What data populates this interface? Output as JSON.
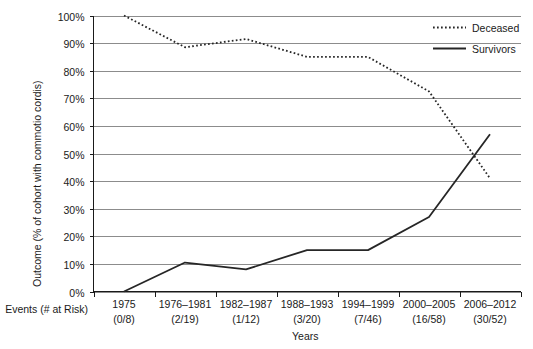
{
  "chart_data": {
    "type": "line",
    "title": "",
    "xlabel": "Years",
    "ylabel": "Outcome (% of cohort with commotio cordis)",
    "categories": [
      "1975",
      "1976–1981",
      "1982–1987",
      "1988–1993",
      "1994–1999",
      "2000–2005",
      "2006–2012"
    ],
    "ylim": [
      0,
      100
    ],
    "ytick_labels": [
      "0%",
      "10%",
      "20%",
      "30%",
      "40%",
      "50%",
      "60%",
      "70%",
      "80%",
      "90%",
      "100%"
    ],
    "ytick_values": [
      0,
      10,
      20,
      30,
      40,
      50,
      60,
      70,
      80,
      90,
      100
    ],
    "grid": true,
    "legend_position": "top-right",
    "series": [
      {
        "name": "Deceased",
        "style": "dotted",
        "values": [
          100,
          88.5,
          91.5,
          85,
          85,
          72.5,
          41
        ]
      },
      {
        "name": "Survivors",
        "style": "solid",
        "values": [
          0,
          10.5,
          8,
          15,
          15,
          27,
          57
        ]
      }
    ],
    "events_row": {
      "label": "Events (# at Risk)",
      "values": [
        "(0/8)",
        "(2/19)",
        "(1/12)",
        "(3/20)",
        "(7/46)",
        "(16/58)",
        "(30/52)"
      ]
    }
  },
  "legend": {
    "items": [
      {
        "label": "Deceased",
        "style": "dotted"
      },
      {
        "label": "Survivors",
        "style": "solid"
      }
    ]
  },
  "colors": {
    "line": "#262626",
    "grid": "#808080",
    "axis": "#1a1a1a",
    "background": "#ffffff"
  }
}
